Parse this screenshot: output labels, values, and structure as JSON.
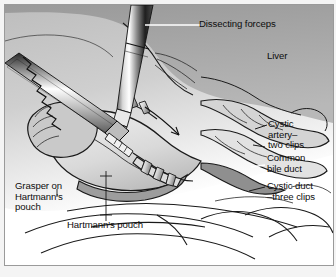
{
  "figure": {
    "type": "medical-illustration",
    "style": "grayscale line-and-tone drawing",
    "frame_color": "#9a9a9a",
    "background_color": "#ffffff",
    "text_color": "#0d0d0d"
  },
  "labels": {
    "dissecting_forceps": "Dissecting forceps",
    "liver": "Liver",
    "cystic_artery": "Cystic\nartery–\ntwo clips",
    "common_bile_duct": "Common\nbile duct",
    "cystic_duct": "Cystic duct\n–three clips",
    "grasper": "Grasper on\nHartmann's\npouch",
    "hartmanns_pouch": "Hartmann's pouch"
  },
  "structures": {
    "liver_tone": "#a3a3a3",
    "gallbladder_tone": "#dcdcdc",
    "shadow_tone": "#8d8d8d",
    "metal_light": "#ffffff",
    "metal_dark": "#2b2b2b",
    "outline": "#1a1a1a"
  }
}
